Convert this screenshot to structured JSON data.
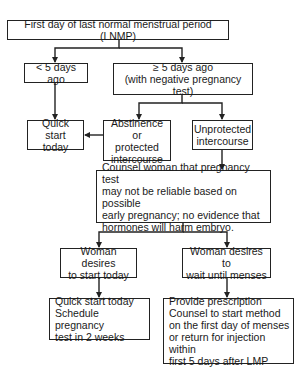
{
  "flowchart": {
    "nodes": {
      "lnmp": "First day of last normal menstrual period (LNMP)",
      "less_5": "< 5 days ago",
      "ge_5": "≥ 5 days ago\n(with negative pregnancy test)",
      "quick_start": "Quick\nstart today",
      "abstinence": "Abstinence or\nprotected\nintercourse",
      "unprotected": "Unprotected\nintercourse",
      "counsel": "Counsel woman that pregnancy test\nmay not be reliable based on possible\nearly pregnancy; no evidence that\nhormones will harm embryo.",
      "desire_today": "Woman desires\nto start today",
      "desire_wait": "Woman desires to\nwait until menses",
      "quick_start_schedule": "Quick start today\nSchedule pregnancy\ntest in 2 weeks",
      "prescription": "Provide prescription\nCounsel to start method\non the first day of menses\nor return for injection within\nfirst 5 days after LMP"
    },
    "edges": [
      [
        "lnmp",
        "less_5"
      ],
      [
        "lnmp",
        "ge_5"
      ],
      [
        "less_5",
        "quick_start"
      ],
      [
        "ge_5",
        "abstinence"
      ],
      [
        "ge_5",
        "unprotected"
      ],
      [
        "abstinence",
        "quick_start"
      ],
      [
        "unprotected",
        "counsel"
      ],
      [
        "counsel",
        "desire_today"
      ],
      [
        "counsel",
        "desire_wait"
      ],
      [
        "desire_today",
        "quick_start_schedule"
      ],
      [
        "desire_wait",
        "prescription"
      ]
    ]
  }
}
